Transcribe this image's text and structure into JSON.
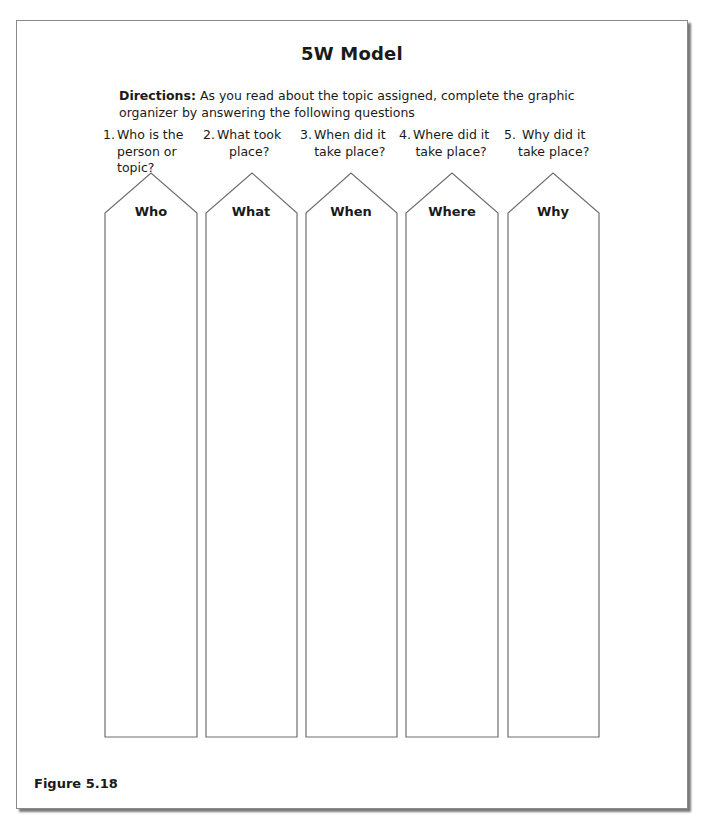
{
  "title": "5W Model",
  "directions": {
    "lead": "Directions:",
    "text": " As you read about the topic assigned, complete the graphic organizer by answering the following questions"
  },
  "questions": [
    {
      "number": "1.",
      "line1": "Who is the",
      "line2": "person or",
      "line3": "topic?"
    },
    {
      "number": "2.",
      "line1": "What took",
      "line2": "place?",
      "line3": ""
    },
    {
      "number": "3.",
      "line1": "When did it",
      "line2": "take place?",
      "line3": ""
    },
    {
      "number": "4.",
      "line1": "Where did it",
      "line2": "take place?",
      "line3": ""
    },
    {
      "number": "5.",
      "line1": "Why did it",
      "line2": "take place?",
      "line3": ""
    }
  ],
  "arrows": [
    {
      "label": "Who"
    },
    {
      "label": "What"
    },
    {
      "label": "When"
    },
    {
      "label": "Where"
    },
    {
      "label": "Why"
    }
  ],
  "figure_label": "Figure 5.18",
  "colors": {
    "text": "#1a1a1a",
    "outline": "#6e6e6e",
    "frame_border": "#8a8a8a",
    "shadow": "#7a7a7a"
  }
}
